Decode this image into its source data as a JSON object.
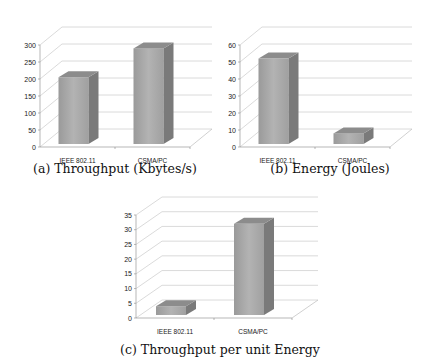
{
  "chart_data": [
    {
      "type": "bar",
      "title": "(a) Throughput (Kbytes/s)",
      "categories": [
        "IEEE 802.11",
        "CSMA/PC"
      ],
      "values": [
        205,
        290
      ],
      "xlabel": "",
      "ylabel": "",
      "ylim": [
        0,
        300
      ],
      "yticks": [
        0,
        50,
        100,
        150,
        200,
        250,
        300
      ],
      "grid": true,
      "style": "3d-column"
    },
    {
      "type": "bar",
      "title": "(b) Energy (Joules)",
      "categories": [
        "IEEE 802.11",
        "CSMA/PC"
      ],
      "values": [
        52,
        8
      ],
      "xlabel": "",
      "ylabel": "",
      "ylim": [
        0,
        60
      ],
      "yticks": [
        0,
        10,
        20,
        30,
        40,
        50,
        60
      ],
      "grid": true,
      "style": "3d-column"
    },
    {
      "type": "bar",
      "title": "(c) Throughput per unit Energy",
      "categories": [
        "IEEE 802.11",
        "CSMA/PC"
      ],
      "values": [
        4,
        32
      ],
      "xlabel": "",
      "ylabel": "",
      "ylim": [
        0,
        35
      ],
      "yticks": [
        0,
        5,
        10,
        15,
        20,
        25,
        30,
        35
      ],
      "grid": true,
      "style": "3d-column"
    }
  ],
  "captions": {
    "a": "(a) Throughput (Kbytes/s)",
    "b": "(b) Energy (Joules)",
    "c": "(c) Throughput per unit Energy"
  },
  "colors": {
    "bar_front": "#a6a6a6",
    "bar_side": "#7a7a7a",
    "bar_top": "#8c8c8c",
    "grid": "#d0d0d0"
  }
}
